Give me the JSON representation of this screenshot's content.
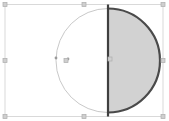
{
  "document": {
    "title": "Circle segment selection",
    "canvas_width": 169,
    "canvas_height": 121,
    "background_color": "#ffffff"
  },
  "colors": {
    "frame_stroke": "#d9d9d9",
    "handle_fill": "#cfcfcf",
    "handle_stroke": "#b0b0b0",
    "circle_stroke": "#c9c9c9",
    "segment_fill": "#d2d2d2",
    "segment_stroke": "#4a4a4a",
    "chord_stroke": "#3f3f3f",
    "point_fill": "#9a9a9a"
  },
  "selection_frame": {
    "label": "selection-bounding-box",
    "x": 5,
    "y": 4.5,
    "width": 158,
    "height": 112,
    "stroke_width": 1
  },
  "handles": {
    "label": "resize-handles",
    "size": 4,
    "items": [
      {
        "name": "handle-top-left",
        "x": 5,
        "y": 4.5
      },
      {
        "name": "handle-top-center",
        "x": 84,
        "y": 4.5
      },
      {
        "name": "handle-top-right",
        "x": 163,
        "y": 4.5
      },
      {
        "name": "handle-middle-left",
        "x": 5,
        "y": 60.5
      },
      {
        "name": "handle-middle-right",
        "x": 163,
        "y": 60.5
      },
      {
        "name": "handle-bottom-left",
        "x": 5,
        "y": 116.5
      },
      {
        "name": "handle-bottom-center",
        "x": 84,
        "y": 116.5
      },
      {
        "name": "handle-bottom-right",
        "x": 163,
        "y": 116.5
      }
    ]
  },
  "circle": {
    "label": "construction-circle",
    "center_x": 108,
    "center_y": 60.5,
    "radius": 52,
    "stroke_width": 1
  },
  "segment": {
    "label": "shaded-half-circle-segment",
    "chord_x": 108,
    "top_y": 8.5,
    "bottom_y": 112.5,
    "radius": 52,
    "stroke_width": 2.2,
    "fill_opacity": 1
  },
  "points": [
    {
      "name": "point-marker-a",
      "x": 56,
      "y": 58,
      "radius": 1.4
    },
    {
      "name": "point-marker-b",
      "x": 68,
      "y": 59,
      "radius": 1.4
    },
    {
      "name": "point-marker-center",
      "x": 110,
      "y": 59,
      "radius": 1.4
    }
  ],
  "vertex_handles": [
    {
      "name": "vertex-handle-left",
      "x": 66,
      "y": 60.5
    },
    {
      "name": "vertex-handle-segment-center",
      "x": 110,
      "y": 59
    }
  ]
}
